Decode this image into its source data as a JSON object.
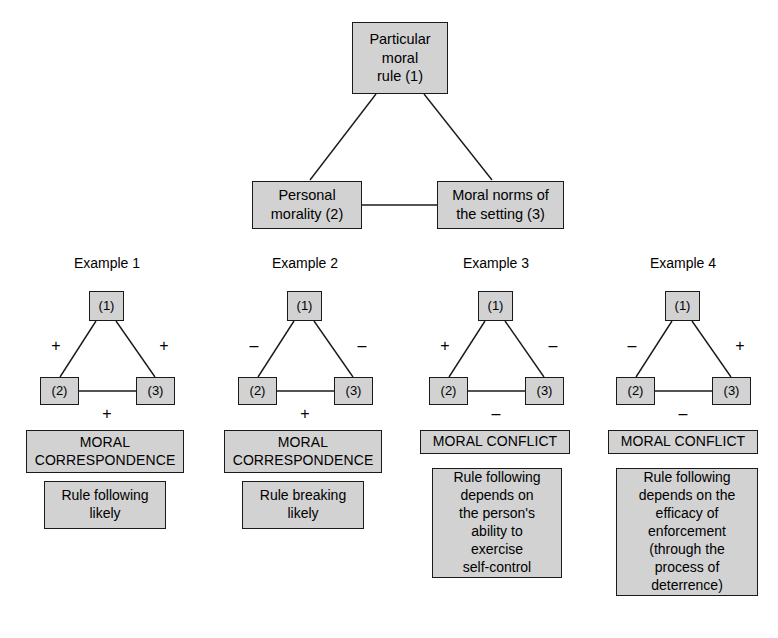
{
  "diagram": {
    "title": "",
    "model": {
      "top_node": {
        "label": "Particular\nmoral\nrule (1)"
      },
      "left_node": {
        "label": "Personal\nmorality (2)"
      },
      "right_node": {
        "label": "Moral norms of\nthe setting (3)"
      }
    },
    "node_short_labels": {
      "one": "(1)",
      "two": "(2)",
      "three": "(3)"
    },
    "signs": {
      "plus": "+",
      "minus": "–"
    },
    "examples": [
      {
        "title": "Example 1",
        "sign_left": "+",
        "sign_right": "+",
        "sign_bottom": "+",
        "outcome_head": "MORAL\nCORRESPONDENCE",
        "outcome_body": "Rule following\nlikely"
      },
      {
        "title": "Example 2",
        "sign_left": "–",
        "sign_right": "–",
        "sign_bottom": "+",
        "outcome_head": "MORAL\nCORRESPONDENCE",
        "outcome_body": "Rule breaking\nlikely"
      },
      {
        "title": "Example 3",
        "sign_left": "+",
        "sign_right": "–",
        "sign_bottom": "–",
        "outcome_head": "MORAL CONFLICT",
        "outcome_body": "Rule following\ndepends on\nthe person's\nability to\nexercise\nself-control"
      },
      {
        "title": "Example 4",
        "sign_left": "–",
        "sign_right": "+",
        "sign_bottom": "–",
        "outcome_head": "MORAL CONFLICT",
        "outcome_body": "Rule following\ndepends on the\nefficacy of\nenforcement\n(through the\nprocess of\ndeterrence)"
      }
    ],
    "colors": {
      "box_fill": "#d2d2d2",
      "box_border": "#1a1a1a",
      "line": "#1a1a1a",
      "text": "#000000",
      "background": "#ffffff"
    }
  }
}
